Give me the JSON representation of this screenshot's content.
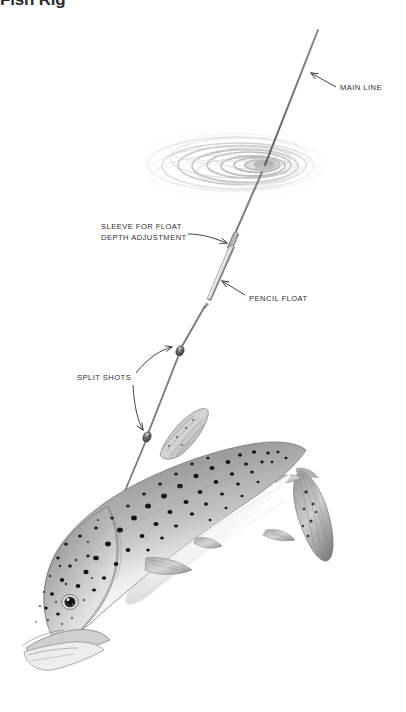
{
  "page": {
    "title": "Fish Rig",
    "background_color": "#ffffff",
    "width": 406,
    "height": 712
  },
  "diagram": {
    "name": "pencil-float-rig-diagram",
    "ink_color": "#2e2e2e",
    "line_color": "#6e6e6e",
    "labels": [
      {
        "id": "main-line",
        "text": "MAIN LINE"
      },
      {
        "id": "sleeve",
        "line1": "SLEEVE FOR FLOAT",
        "line2": "DEPTH ADJUSTMENT"
      },
      {
        "id": "pencil-float",
        "text": "PENCIL FLOAT"
      },
      {
        "id": "split-shots",
        "text": "SPLIT SHOTS"
      }
    ],
    "elements": [
      {
        "id": "water-ripple",
        "description": "concentric elliptical surface ripples"
      },
      {
        "id": "main-line",
        "description": "monofilament line from top right into water"
      },
      {
        "id": "pencil-float",
        "description": "slim tapered float threaded on the line"
      },
      {
        "id": "float-sleeve",
        "description": "small sleeve above float for depth adjustment"
      },
      {
        "id": "split-shot-upper",
        "description": "upper lead split shot on line"
      },
      {
        "id": "split-shot-lower",
        "description": "lower lead split shot on line"
      },
      {
        "id": "fish",
        "description": "spotted trout hooked on the line, head down-left"
      }
    ]
  }
}
